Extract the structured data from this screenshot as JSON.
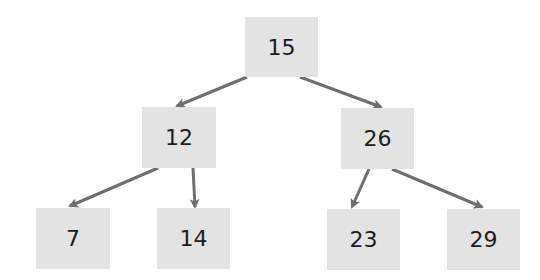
{
  "diagram": {
    "type": "binary-search-tree",
    "colors": {
      "background": "#ffffff",
      "node_fill": "#e3e3e3",
      "node_text": "#1c1c1c",
      "edge": "#6e6e6e"
    },
    "nodes": [
      {
        "id": "n15",
        "label": "15",
        "x": 245,
        "y": 17,
        "w": 73,
        "h": 60
      },
      {
        "id": "n12",
        "label": "12",
        "x": 142,
        "y": 107,
        "w": 74,
        "h": 61
      },
      {
        "id": "n26",
        "label": "26",
        "x": 341,
        "y": 108,
        "w": 73,
        "h": 61
      },
      {
        "id": "n7",
        "label": "7",
        "x": 36,
        "y": 208,
        "w": 74,
        "h": 61
      },
      {
        "id": "n14",
        "label": "14",
        "x": 157,
        "y": 208,
        "w": 73,
        "h": 61
      },
      {
        "id": "n23",
        "label": "23",
        "x": 327,
        "y": 209,
        "w": 73,
        "h": 61
      },
      {
        "id": "n29",
        "label": "29",
        "x": 447,
        "y": 209,
        "w": 73,
        "h": 61
      }
    ],
    "edges": [
      {
        "from": "15",
        "to": "12",
        "x1": 247,
        "y1": 77,
        "x2": 177,
        "y2": 106
      },
      {
        "from": "15",
        "to": "26",
        "x1": 300,
        "y1": 77,
        "x2": 381,
        "y2": 107
      },
      {
        "from": "12",
        "to": "7",
        "x1": 158,
        "y1": 168,
        "x2": 70,
        "y2": 206
      },
      {
        "from": "12",
        "to": "14",
        "x1": 193,
        "y1": 168,
        "x2": 195,
        "y2": 207
      },
      {
        "from": "26",
        "to": "23",
        "x1": 369,
        "y1": 169,
        "x2": 352,
        "y2": 207
      },
      {
        "from": "26",
        "to": "29",
        "x1": 392,
        "y1": 169,
        "x2": 482,
        "y2": 207
      }
    ]
  }
}
